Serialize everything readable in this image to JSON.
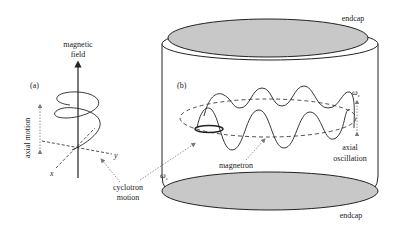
{
  "panel_a": {
    "label": "(a)",
    "field_label_line1": "magnetic",
    "field_label_line2": "field",
    "axial_motion_label": "axial motion",
    "x_label": "x",
    "y_label": "y",
    "cyclotron_line1": "cyclotron",
    "cyclotron_line2": "motion"
  },
  "panel_b": {
    "label": "(b)",
    "endcap_top": "endcap",
    "endcap_bottom": "endcap",
    "omega_z": "ω",
    "omega_z_sub": "z",
    "omega_c": "ω",
    "omega_c_sub": "c",
    "magnetron_label": "magnetron",
    "axial_line1": "axial",
    "axial_line2": "oscillation"
  },
  "colors": {
    "endcap_fill": "#c8c8c8",
    "stroke": "#222222",
    "dotted": "#777777"
  }
}
